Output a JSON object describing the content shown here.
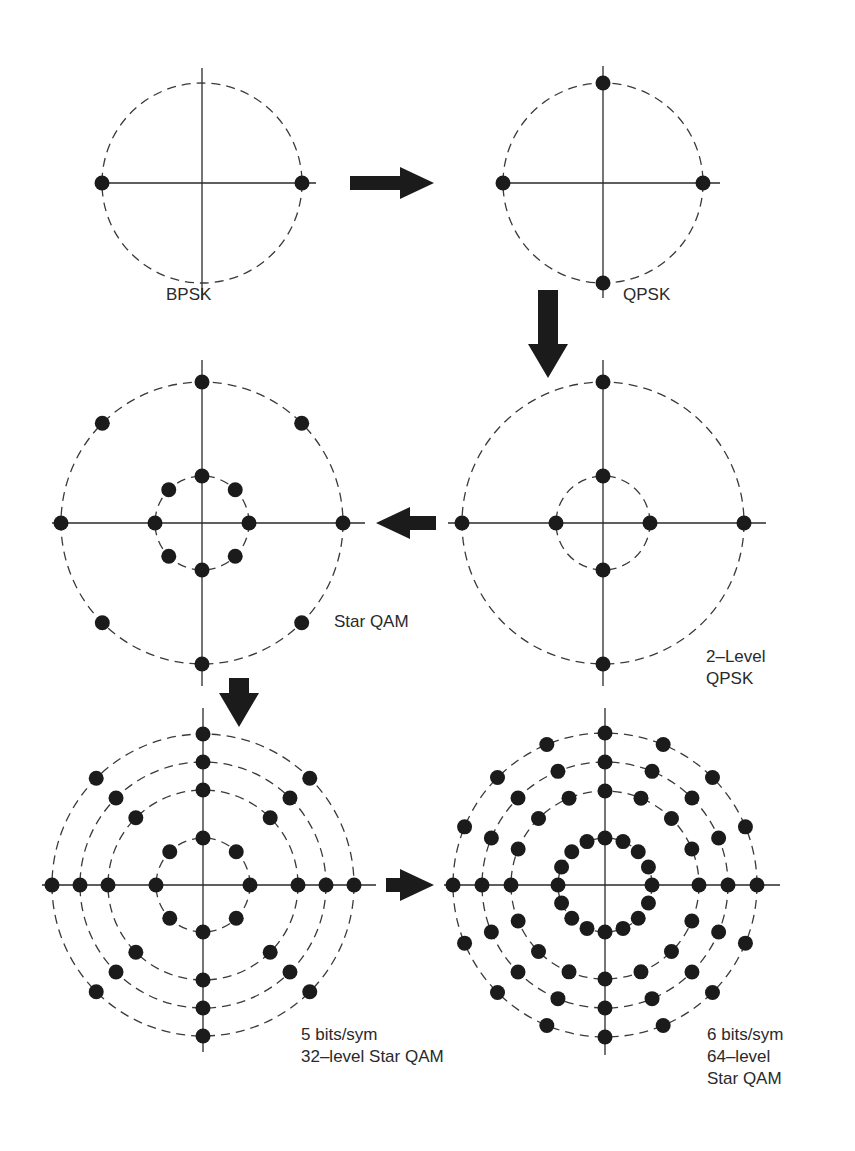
{
  "figure": {
    "colors": {
      "ink": "#1b1b1b",
      "line": "#2a2a2a",
      "background": "#ffffff"
    }
  },
  "diagrams": [
    {
      "id": "bpsk",
      "label_lines": [
        "BPSK"
      ],
      "center": [
        202,
        183
      ],
      "axis_extent": {
        "x": [
          95,
          316
        ],
        "y": [
          68,
          300
        ]
      },
      "rings": [
        {
          "r": 100,
          "points": 2,
          "offset_deg": 0
        }
      ],
      "label_pos": [
        166,
        300
      ]
    },
    {
      "id": "qpsk",
      "label_lines": [
        "QPSK"
      ],
      "center": [
        603,
        183
      ],
      "axis_extent": {
        "x": [
          496,
          720
        ],
        "y": [
          66,
          298
        ]
      },
      "rings": [
        {
          "r": 100,
          "points": 4,
          "offset_deg": 0
        }
      ],
      "label_pos": [
        623,
        300
      ]
    },
    {
      "id": "star-qam",
      "label_lines": [
        "Star QAM"
      ],
      "center": [
        202,
        523
      ],
      "axis_extent": {
        "x": [
          52,
          365
        ],
        "y": [
          360,
          686
        ]
      },
      "rings": [
        {
          "r": 47,
          "points": 8,
          "offset_deg": 0
        },
        {
          "r": 141,
          "points": 8,
          "offset_deg": 0
        }
      ],
      "label_pos": [
        334,
        627
      ]
    },
    {
      "id": "two-level-qpsk",
      "label_lines": [
        "2–Level",
        "QPSK"
      ],
      "center": [
        603,
        523
      ],
      "axis_extent": {
        "x": [
          448,
          766
        ],
        "y": [
          360,
          686
        ]
      },
      "rings": [
        {
          "r": 47,
          "points": 4,
          "offset_deg": 0
        },
        {
          "r": 141,
          "points": 4,
          "offset_deg": 0
        }
      ],
      "label_pos": [
        706,
        662
      ]
    },
    {
      "id": "star-qam-32",
      "label_lines": [
        "5 bits/sym",
        "32–level Star QAM"
      ],
      "center": [
        203,
        885
      ],
      "axis_extent": {
        "x": [
          42,
          376
        ],
        "y": [
          708,
          1052
        ]
      },
      "rings": [
        {
          "r": 47,
          "points": 8,
          "offset_deg": 0
        },
        {
          "r": 95,
          "points": 8,
          "offset_deg": 0
        },
        {
          "r": 123,
          "points": 8,
          "offset_deg": 0
        },
        {
          "r": 151,
          "points": 8,
          "offset_deg": 0
        }
      ],
      "label_pos": [
        301,
        1040
      ]
    },
    {
      "id": "star-qam-64",
      "label_lines": [
        "6 bits/sym",
        "64–level",
        "Star QAM"
      ],
      "center": [
        605,
        885
      ],
      "axis_extent": {
        "x": [
          444,
          780
        ],
        "y": [
          708,
          1055
        ]
      },
      "rings": [
        {
          "r": 47,
          "points": 16,
          "offset_deg": 0
        },
        {
          "r": 94,
          "points": 16,
          "offset_deg": 0
        },
        {
          "r": 123,
          "points": 16,
          "offset_deg": 0
        },
        {
          "r": 152,
          "points": 16,
          "offset_deg": 0
        }
      ],
      "label_pos": [
        707,
        1040
      ]
    }
  ],
  "arrows": [
    {
      "id": "bpsk-to-qpsk",
      "direction": "right",
      "from": [
        350,
        183
      ],
      "to": [
        434,
        183
      ]
    },
    {
      "id": "qpsk-to-two-level",
      "direction": "down",
      "from": [
        548,
        290
      ],
      "to": [
        548,
        378
      ]
    },
    {
      "id": "two-level-to-star-qam",
      "direction": "left",
      "from": [
        436,
        523
      ],
      "to": [
        376,
        523
      ]
    },
    {
      "id": "star-qam-to-32",
      "direction": "down",
      "from": [
        239,
        678
      ],
      "to": [
        239,
        727
      ]
    },
    {
      "id": "32-to-64",
      "direction": "right",
      "from": [
        386,
        885
      ],
      "to": [
        434,
        885
      ]
    }
  ]
}
